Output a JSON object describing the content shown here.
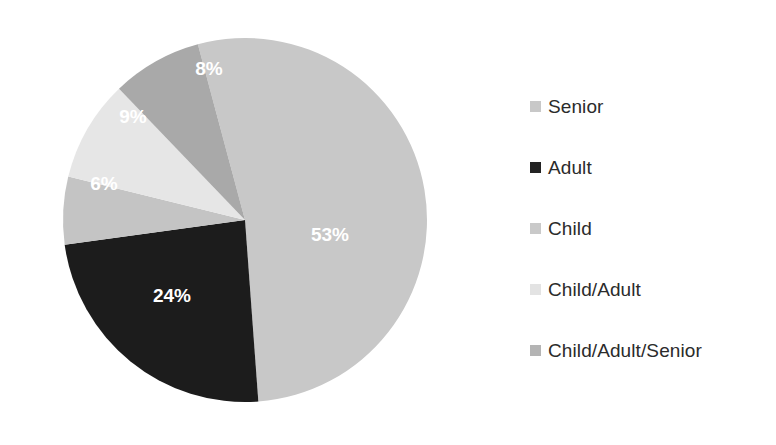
{
  "chart_data": {
    "type": "pie",
    "title": "",
    "subtitle": "",
    "xlabel": "",
    "ylabel": "",
    "grid": false,
    "legend_position": "right",
    "units": "percent",
    "total": 100,
    "categories": [
      "Senior",
      "Adult",
      "Child",
      "Child/Adult",
      "Child/Adult/Senior"
    ],
    "values": [
      53,
      24,
      6,
      9,
      8
    ],
    "data_labels": [
      "53%",
      "24%",
      "6%",
      "9%",
      "8%"
    ],
    "colors": [
      "#c8c8c8",
      "#1c1c1c",
      "#c4c4c4",
      "#e6e6e6",
      "#a9a9a9"
    ],
    "slices": [
      {
        "name": "Senior",
        "value": 53,
        "label": "53%",
        "color": "#c8c8c8",
        "start_angle": -15,
        "end_angle": 175.8,
        "label_x": 330,
        "label_y": 236,
        "label_color": "#ffffff"
      },
      {
        "name": "Adult",
        "value": 24,
        "label": "24%",
        "color": "#1c1c1c",
        "start_angle": 175.8,
        "end_angle": 262.2,
        "label_x": 172,
        "label_y": 297,
        "label_color": "#ffffff"
      },
      {
        "name": "Child",
        "value": 6,
        "label": "6%",
        "color": "#c4c4c4",
        "start_angle": 262.2,
        "end_angle": 283.8,
        "label_x": 104,
        "label_y": 185,
        "label_color": "#ffffff"
      },
      {
        "name": "Child/Adult",
        "value": 9,
        "label": "9%",
        "color": "#e6e6e6",
        "start_angle": 283.8,
        "end_angle": 316.2,
        "label_x": 133,
        "label_y": 118,
        "label_color": "#ffffff"
      },
      {
        "name": "Child/Adult/Senior",
        "value": 8,
        "label": "8%",
        "color": "#a9a9a9",
        "start_angle": 316.2,
        "end_angle": 345,
        "label_x": 209,
        "label_y": 70,
        "label_color": "#ffffff"
      }
    ],
    "geometry": {
      "center_x": 245,
      "center_y": 220,
      "radius": 182
    }
  },
  "legend": {
    "items": [
      {
        "label": "Senior",
        "color": "#c8c8c8"
      },
      {
        "label": "Adult",
        "color": "#232323"
      },
      {
        "label": "Child",
        "color": "#c9c9c9"
      },
      {
        "label": "Child/Adult",
        "color": "#e3e3e3"
      },
      {
        "label": "Child/Adult/Senior",
        "color": "#b4b4b4"
      }
    ]
  }
}
